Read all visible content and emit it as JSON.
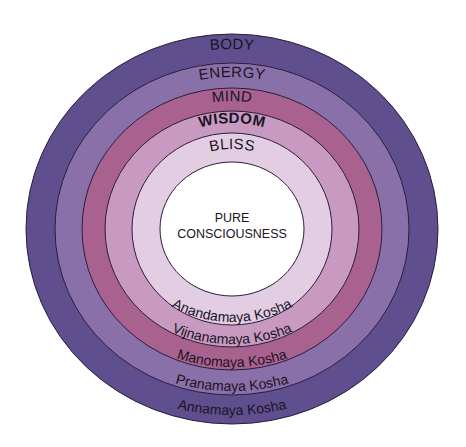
{
  "diagram": {
    "center_label": [
      "PURE",
      "CONSCIOUSNESS"
    ],
    "layers": [
      {
        "name": "BODY",
        "sanskrit": "Annamaya Kosha",
        "color": "#5f4f8e"
      },
      {
        "name": "ENERGY",
        "sanskrit": "Pranamaya Kosha",
        "color": "#8a70a8"
      },
      {
        "name": "MIND",
        "sanskrit": "Manomaya Kosha",
        "color": "#a9628f"
      },
      {
        "name": "WISDOM",
        "sanskrit": "Vijnanamaya Kosha",
        "color": "#c89ac1"
      },
      {
        "name": "BLISS",
        "sanskrit": "Anandamaya Kosha",
        "color": "#e3cde3"
      }
    ],
    "core_color": "#ffffff"
  }
}
